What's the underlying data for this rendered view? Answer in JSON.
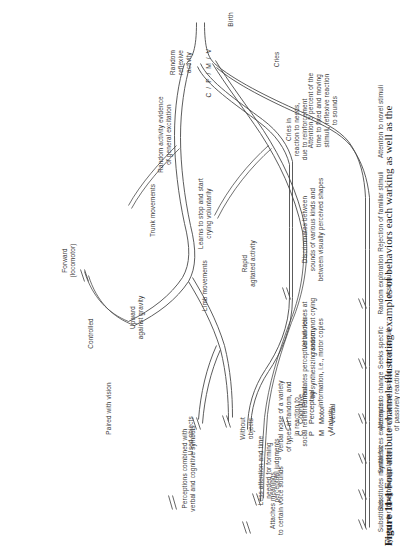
{
  "figure": {
    "number": "Figure 11-1",
    "caption": "Four attribute channels illustrating examples of behaviors each  warking as well as the",
    "axis_start": "Birth",
    "axis_end": "Maturity",
    "channel_marks": "C / P / M / V"
  },
  "legend": {
    "title": "",
    "items": [
      {
        "key": "C",
        "label": "Cognitive"
      },
      {
        "key": "P",
        "label": "Perceptual"
      },
      {
        "key": "M",
        "label": "Motor"
      },
      {
        "key": "V",
        "label": "Verbal"
      }
    ]
  },
  "channels": [
    {
      "key": "C",
      "name": "Cognitive",
      "nodes": [
        "Attention to novel stimuli",
        "Rejection of familiar stimuli",
        "Random exploration\nof stimuli",
        "Seeks specific\nnovel stimuli",
        "Attempts to change\nenvironment instead\nof passively reacting",
        "Synthesizes experiences",
        "Substitutes mental for\ndirect manipulation",
        "Substitutes\nsymbols for thoughts"
      ]
    },
    {
      "key": "P",
      "name": "Perceptual",
      "nodes": [
        "Attention 5 percent of the\ntime to fixed and moving\nstimuli, reflexive reaction\nto sounds",
        "Discriminates between\nsounds of various kinds and\nbetween visually perceived shapes",
        "Formulates perceptual wholes\nby synthesizing sensory\ninformation, i.e., motor copies",
        "Less attention and time\nneeded for forming\nperceptual judgments",
        "Perceptions combined with\nverbal and cognitive symbols"
      ]
    },
    {
      "key": "M",
      "name": "Motor",
      "nodes": [
        "Random\nreflexive\nactivity",
        "Random activity evidence\nof general excitation",
        "Trunk movements",
        "Limb movements",
        "Upward\nagainst gravity",
        "Forward\n(locomotor)",
        "Controlled",
        "Rapid\nagitated activity",
        "Paired with vision",
        "Without\nobjects",
        "Used objects"
      ]
    },
    {
      "key": "V",
      "name": "Verbal",
      "nodes": [
        "Cries",
        "Cries in\nreaction to needs,\ndue to reinforcement",
        "Learns to stop and start\ncrying voluntarily",
        "Verbal noises at\nrandom, not crying",
        "Verbal noise of a variety\nof types at random, and\nin reaction to\nsocial reinforcement",
        "Attaches meanings\nto certain voice sounds"
      ]
    }
  ]
}
